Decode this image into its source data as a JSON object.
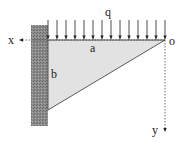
{
  "diagram": {
    "type": "cantilever-triangular-plate",
    "labels": {
      "load": "q",
      "top_edge": "a",
      "left_edge": "b",
      "origin": "o",
      "x_axis": "x",
      "y_axis": "y"
    },
    "load": {
      "arrow_count": 14,
      "arrow_x": [
        48,
        57,
        66,
        75,
        84,
        93,
        102,
        111,
        120,
        129,
        138,
        147,
        156,
        165
      ],
      "arrow_top_y": 20,
      "arrow_tip_y": 40
    },
    "triangle": {
      "points": [
        [
          48,
          40
        ],
        [
          165,
          40
        ],
        [
          48,
          110
        ]
      ],
      "fill": "#e2e2e2",
      "stroke": "#333333"
    },
    "wall": {
      "x": 31,
      "y": 25,
      "width": 17,
      "height": 101,
      "fill": "#8c8c8c",
      "hatch": "#6a6a6a"
    },
    "axes": {
      "x_axis": {
        "from": [
          165,
          40
        ],
        "to": [
          19,
          40
        ]
      },
      "y_axis": {
        "from": [
          165,
          40
        ],
        "to": [
          165,
          132
        ]
      },
      "style": "dotted",
      "color": "#333333"
    }
  }
}
